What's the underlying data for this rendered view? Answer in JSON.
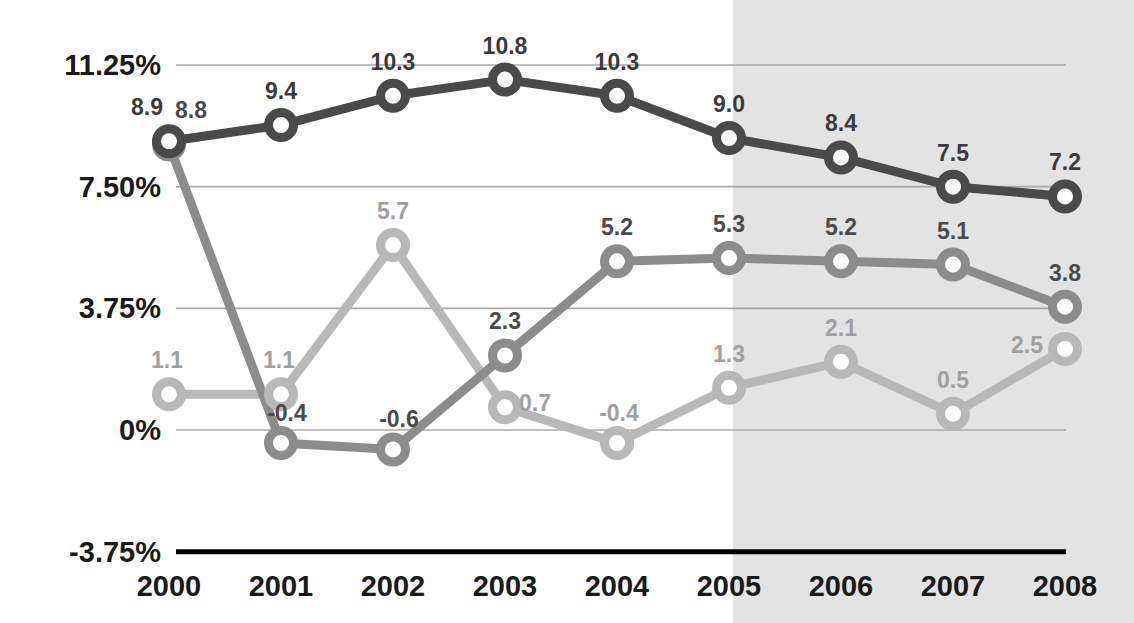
{
  "chart_data": {
    "type": "line",
    "title": "",
    "subtitle": "",
    "xlabel": "",
    "ylabel": "",
    "categories": [
      "2000",
      "2001",
      "2002",
      "2003",
      "2004",
      "2005",
      "2006",
      "2007",
      "2008"
    ],
    "ytick_labels": [
      "11.25%",
      "7.50%",
      "3.75%",
      "0%",
      "-3.75%"
    ],
    "ytick_values": [
      11.25,
      7.5,
      3.75,
      0,
      -3.75
    ],
    "ylim": [
      -3.75,
      11.25
    ],
    "grid": true,
    "legend": "none",
    "series": [
      {
        "name": "series-dark",
        "color": "#4a4a4a",
        "label_color": "#3b3b3b",
        "values": [
          8.9,
          9.4,
          10.3,
          10.8,
          10.3,
          9.0,
          8.4,
          7.5,
          7.2
        ],
        "labels": [
          "8.9",
          "9.4",
          "10.3",
          "10.8",
          "10.3",
          "9.0",
          "8.4",
          "7.5",
          "7.2"
        ]
      },
      {
        "name": "series-medium",
        "color": "#8c8c8c",
        "label_color": "#4a4a4a",
        "values": [
          8.8,
          -0.4,
          -0.6,
          2.3,
          5.2,
          5.3,
          5.2,
          5.1,
          3.8
        ],
        "labels": [
          "8.8",
          "-0.4",
          "-0.6",
          "2.3",
          "5.2",
          "5.3",
          "5.2",
          "5.1",
          "3.8"
        ]
      },
      {
        "name": "series-light",
        "color": "#b8b8b8",
        "label_color": "#a0a0a0",
        "values": [
          1.1,
          1.1,
          5.7,
          0.7,
          -0.4,
          1.3,
          2.1,
          0.5,
          2.5
        ],
        "labels": [
          "1.1",
          "1.1",
          "5.7",
          "0.7",
          "-0.4",
          "1.3",
          "2.1",
          "0.5",
          "2.5"
        ]
      }
    ],
    "annotations": {
      "forecast_shading": {
        "start_category": "2005",
        "end_category": "2008",
        "color": "#e3e3e3",
        "note": "shaded band covering 2006-2008 projections"
      }
    },
    "colors": {
      "background": "#ffffff",
      "shaded_band": "#e3e3e3",
      "gridline": "#a8a8a8",
      "axis_line": "#000000",
      "dark_series": "#4a4a4a",
      "medium_series": "#8c8c8c",
      "light_series": "#b8b8b8",
      "tick_text": "#1a1a1a"
    }
  }
}
